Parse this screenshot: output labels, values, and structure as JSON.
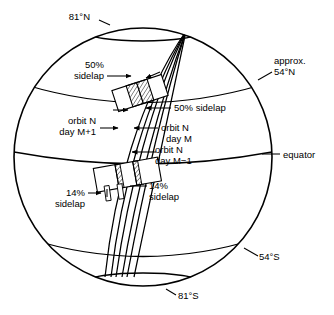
{
  "figure": {
    "stroke_color": "#000000",
    "background_color": "#ffffff"
  },
  "labels": {
    "north_pole_parallel": "81°N",
    "south_pole_parallel": "81°S",
    "north_mid_parallel_line1": "approx.",
    "north_mid_parallel_line2": "54°N",
    "south_mid_parallel": "54°S",
    "equator": "equator",
    "sidelap_50_upper_line1": "50%",
    "sidelap_50_upper_line2": "sidelap",
    "sidelap_50_mid": "50% sidelap",
    "orbit_left_line1": "orbit N",
    "orbit_left_line2": "day M+1",
    "orbit_mid_line1": "orbit N",
    "orbit_mid_line2": "day M",
    "orbit_right_line1": "orbit N",
    "orbit_right_line2": "day M−1",
    "sidelap_14_right_line1": "14%",
    "sidelap_14_right_line2": "sidelap",
    "sidelap_14_left_line1": "14%",
    "sidelap_14_left_line2": "sidelap"
  }
}
